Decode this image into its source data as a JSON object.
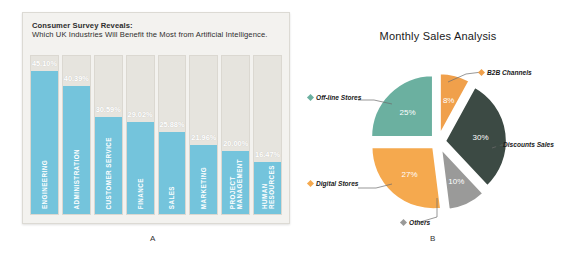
{
  "panel_a": {
    "caption": "A",
    "header_line1": "Consumer Survey Reveals:",
    "header_line2": "Which UK Industries Will Benefit the Most from Artificial Intelligence.",
    "bar_color": "#74c4dc",
    "track_color": "#e6e4de",
    "panel_background": "#f3f2ef",
    "chart_data": {
      "type": "bar",
      "title": "Consumer Survey Reveals: Which UK Industries Will Benefit the Most from Artificial Intelligence.",
      "xlabel": "",
      "ylabel": "",
      "ylim": [
        0,
        50
      ],
      "grid": false,
      "legend": "none",
      "categories": [
        "ENGINEERING",
        "ADMINISTRATION",
        "CUSTOMER SERVICE",
        "FINANCE",
        "SALES",
        "MARKETING",
        "PROJECT MANAGEMENT",
        "HUMAN RESOURCES"
      ],
      "values": [
        45.1,
        40.39,
        30.59,
        29.02,
        25.88,
        21.96,
        20.0,
        16.47
      ],
      "value_labels": [
        "45.10%",
        "40.39%",
        "30.59%",
        "29.02%",
        "25.88%",
        "21.96%",
        "20.00%",
        "16.47%"
      ]
    }
  },
  "panel_b": {
    "caption": "B",
    "title": "Monthly Sales Analysis",
    "chart_data": {
      "type": "pie",
      "title": "Monthly Sales Analysis",
      "legend": "callout-labels",
      "labels": [
        "Off-line Stores",
        "B2B Channels",
        "Discounts Sales",
        "Others",
        "Digital Stores"
      ],
      "values": [
        25,
        8,
        30,
        10,
        27
      ],
      "value_labels": [
        "25%",
        "8%",
        "30%",
        "10%",
        "27%"
      ],
      "colors": [
        "#6bb0a0",
        "#f0a04b",
        "#3c4a44",
        "#9a9a99",
        "#f5a94e"
      ],
      "exploded": true
    },
    "callouts": [
      {
        "label": "Off-line Stores",
        "color": "#6bb0a0"
      },
      {
        "label": "B2B Channels",
        "color": "#f0a04b"
      },
      {
        "label": "Discounts Sales",
        "color": "#3c4a44"
      },
      {
        "label": "Others",
        "color": "#9a9a99"
      },
      {
        "label": "Digital Stores",
        "color": "#f5a94e"
      }
    ]
  }
}
